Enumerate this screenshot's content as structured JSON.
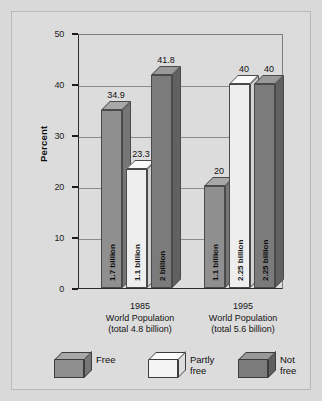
{
  "chart_data": {
    "type": "bar",
    "title": "",
    "subtitle": "",
    "xlabel": "",
    "ylabel": "Percent",
    "ylim": [
      0,
      50
    ],
    "yticks": [
      0,
      10,
      20,
      30,
      40,
      50
    ],
    "grid": true,
    "legend_position": "bottom",
    "categories": [
      "1985 World Population (total 4.8 billion)",
      "1995 World Population (total 5.6 billion)"
    ],
    "series": [
      {
        "name": "Free",
        "values": [
          34.9,
          20
        ],
        "point_labels": [
          "34.9",
          "20"
        ],
        "bar_text": [
          "1.7 billion",
          "1.1 billion"
        ],
        "color": "#8f8f8f"
      },
      {
        "name": "Partly free",
        "values": [
          23.3,
          40
        ],
        "point_labels": [
          "23.3",
          "40"
        ],
        "bar_text": [
          "1.1 billion",
          "2.25 billion"
        ],
        "color": "#eeeeee"
      },
      {
        "name": "Not free",
        "values": [
          41.8,
          40
        ],
        "point_labels": [
          "41.8",
          "40"
        ],
        "bar_text": [
          "2 billion",
          "2.25 billion"
        ],
        "color": "#7b7b7b"
      }
    ]
  },
  "axis": {
    "y_label": "Percent",
    "y_ticks": [
      "50",
      "40",
      "30",
      "20",
      "10",
      "0"
    ]
  },
  "groups": [
    {
      "year": "1985",
      "line2": "World Population",
      "line3": "(total 4.8 billion)",
      "bars": [
        {
          "series": "Free",
          "value_label": "34.9",
          "inbar": "1.7 billion",
          "value": 34.9
        },
        {
          "series": "Partly free",
          "value_label": "23.3",
          "inbar": "1.1 billion",
          "value": 23.3
        },
        {
          "series": "Not free",
          "value_label": "41.8",
          "inbar": "2 billion",
          "value": 41.8
        }
      ]
    },
    {
      "year": "1995",
      "line2": "World Population",
      "line3": "(total 5.6 billion)",
      "bars": [
        {
          "series": "Free",
          "value_label": "20",
          "inbar": "1.1 billion",
          "value": 20
        },
        {
          "series": "Partly free",
          "value_label": "40",
          "inbar": "2.25 billion",
          "value": 40
        },
        {
          "series": "Not free",
          "value_label": "40",
          "inbar": "2.25 billion",
          "value": 40
        }
      ]
    }
  ],
  "legend": {
    "items": [
      {
        "label": "Free",
        "swatch": "free-cube-icon",
        "color": "#8f8f8f"
      },
      {
        "label": "Partly\nfree",
        "swatch": "partly-free-cube-icon",
        "color": "#f4f4f4"
      },
      {
        "label": "Not free",
        "swatch": "not-free-cube-icon",
        "color": "#7b7b7b"
      }
    ]
  },
  "colors": {
    "figure_background": "#dcdcdc",
    "page_background": "#d9d9d9",
    "axis": "#1c1c1c",
    "grid": "#8b8b8b"
  }
}
